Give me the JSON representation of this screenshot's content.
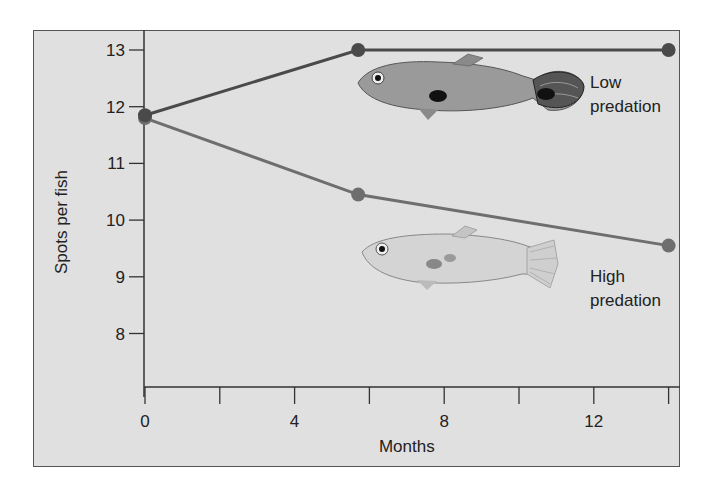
{
  "chart_data": {
    "type": "line",
    "title": "",
    "xlabel": "Months",
    "ylabel": "Spots per fish",
    "xlim": [
      0,
      14
    ],
    "ylim": [
      7,
      13.4
    ],
    "x_ticks": [
      0,
      2,
      4,
      6,
      8,
      10,
      12,
      14
    ],
    "x_tick_labels": [
      "0",
      "",
      "4",
      "",
      "8",
      "",
      "12",
      ""
    ],
    "y_ticks": [
      8,
      9,
      10,
      11,
      12,
      13
    ],
    "y_tick_labels": [
      "8",
      "9",
      "10",
      "11",
      "12",
      "13"
    ],
    "grid": false,
    "legend": "inline labels at right",
    "series": [
      {
        "name": "Low predation",
        "label_lines": [
          "Low",
          "predation"
        ],
        "color": "#4a4a4a",
        "x": [
          0,
          5.7,
          14
        ],
        "values": [
          11.85,
          13.0,
          13.0
        ]
      },
      {
        "name": "High predation",
        "label_lines": [
          "High",
          "predation"
        ],
        "color": "#6e6e6e",
        "x": [
          0,
          5.7,
          14
        ],
        "values": [
          11.8,
          10.45,
          9.55
        ]
      }
    ],
    "annotations": [
      "illustration: brightly spotted guppy (low predation)",
      "illustration: drab guppy (high predation)"
    ]
  }
}
